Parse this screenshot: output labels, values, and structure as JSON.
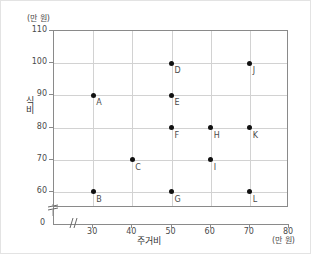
{
  "chart_data": {
    "type": "scatter",
    "title": "",
    "xlabel": "주거비",
    "ylabel": "식비",
    "x_unit": "(만 원)",
    "y_unit": "(만 원)",
    "xlim": [
      20,
      80
    ],
    "ylim": [
      55,
      110
    ],
    "x_ticks": [
      30,
      40,
      50,
      60,
      70,
      80
    ],
    "y_ticks": [
      60,
      70,
      80,
      90,
      100,
      110
    ],
    "origin_label": "0",
    "grid": true,
    "legend": "none",
    "axis_break_x": true,
    "axis_break_y": true,
    "points": [
      {
        "label": "A",
        "x": 30,
        "y": 90
      },
      {
        "label": "B",
        "x": 30,
        "y": 60
      },
      {
        "label": "C",
        "x": 40,
        "y": 70
      },
      {
        "label": "D",
        "x": 50,
        "y": 100
      },
      {
        "label": "E",
        "x": 50,
        "y": 90
      },
      {
        "label": "F",
        "x": 50,
        "y": 80
      },
      {
        "label": "G",
        "x": 50,
        "y": 60
      },
      {
        "label": "H",
        "x": 60,
        "y": 80
      },
      {
        "label": "I",
        "x": 60,
        "y": 70
      },
      {
        "label": "J",
        "x": 70,
        "y": 100
      },
      {
        "label": "K",
        "x": 70,
        "y": 80
      },
      {
        "label": "L",
        "x": 70,
        "y": 60
      }
    ],
    "colors": {
      "point": "#111111",
      "grid": "#d2d2d2",
      "frame": "#8a8a8a",
      "text": "#4a4a4a"
    }
  }
}
